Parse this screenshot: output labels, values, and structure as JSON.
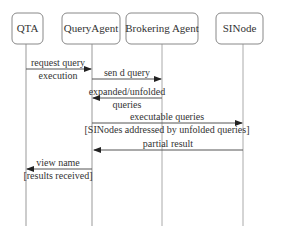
{
  "diagram": {
    "type": "sequence",
    "participants": [
      {
        "id": "qta",
        "label": "QTA"
      },
      {
        "id": "query_agent",
        "label": "QueryAgent"
      },
      {
        "id": "brokering_agent",
        "label": "Brokering Agent"
      },
      {
        "id": "sinode",
        "label": "SINode"
      }
    ],
    "messages": [
      {
        "from": "qta",
        "to": "query_agent",
        "line1": "request query",
        "line2": "execution"
      },
      {
        "from": "query_agent",
        "to": "brokering_agent",
        "line1": "sen d query"
      },
      {
        "from": "brokering_agent",
        "to": "query_agent",
        "line1": "expanded/unfolded",
        "line2": "queries"
      },
      {
        "from": "query_agent",
        "to": "sinode",
        "line1": "executable queries",
        "line2": "[SINodes addressed by unfolded queries]"
      },
      {
        "from": "sinode",
        "to": "query_agent",
        "line1": "partial result"
      },
      {
        "from": "query_agent",
        "to": "qta",
        "line1": "view name",
        "line2": "[results received]"
      }
    ]
  },
  "colors": {
    "stroke": "#777777",
    "text": "#333333",
    "arrow": "#222222",
    "background": "#ffffff"
  }
}
